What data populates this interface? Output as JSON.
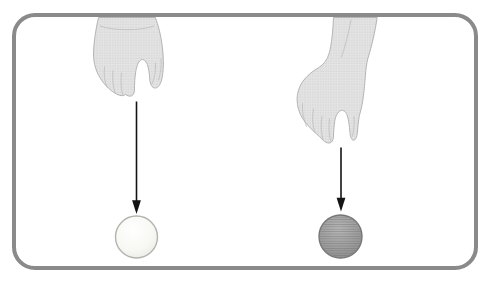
{
  "figure": {
    "kind": "two-hands-dropping-balls-illustration",
    "background": "#ffffff",
    "frame": {
      "stroke": "#8a8a8a"
    },
    "hands": {
      "fill": "#e4e4e4",
      "outline": "#aeaeae",
      "dots": "#9c9c9c",
      "crease": "#b9b9b9",
      "left_icon": "pinching-hand-icon",
      "right_icon": "pinching-hand-icon"
    },
    "arrows": {
      "color": "#141414"
    },
    "balls": {
      "left": {
        "icon": "light-ball-icon",
        "center": "#ffffff",
        "mid": "#f7f7f3",
        "edge": "#e7e7e2",
        "outline": "#b3b3b0"
      },
      "right": {
        "icon": "shaded-ball-icon",
        "center": "#b6b6b6",
        "mid": "#9d9d9d",
        "edge": "#858585",
        "outline": "#777777",
        "lines": "#6c6c6c"
      }
    }
  }
}
